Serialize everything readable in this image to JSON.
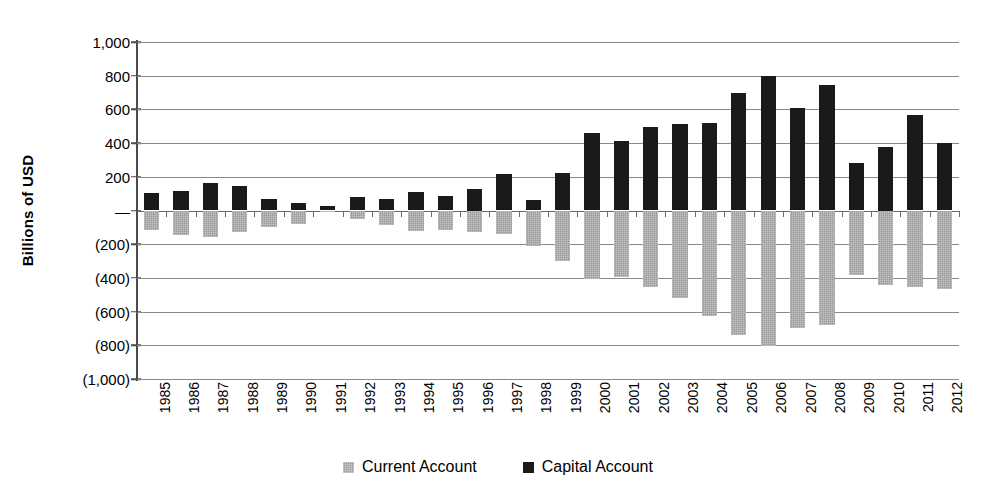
{
  "chart_data": {
    "type": "bar",
    "title": "",
    "subtitle": "",
    "xlabel": "",
    "ylabel": "Billions of USD",
    "ylim": [
      -1000,
      1000
    ],
    "ytick_values": [
      1000,
      800,
      600,
      400,
      200,
      0,
      -200,
      -400,
      -600,
      -800,
      -1000
    ],
    "ytick_labels": [
      "1,000",
      "800",
      "600",
      "400",
      "200",
      "—",
      "(200)",
      "(400)",
      "(600)",
      "(800)",
      "(1,000)"
    ],
    "grid": true,
    "legend_position": "bottom",
    "orientation": "vertical",
    "grouping": "grouped-overlay",
    "categories": [
      "1985",
      "1986",
      "1987",
      "1988",
      "1989",
      "1990",
      "1991",
      "1992",
      "1993",
      "1994",
      "1995",
      "1996",
      "1997",
      "1998",
      "1999",
      "2000",
      "2001",
      "2002",
      "2003",
      "2004",
      "2005",
      "2006",
      "2007",
      "2008",
      "2009",
      "2010",
      "2011",
      "2012"
    ],
    "series": [
      {
        "name": "Capital Account",
        "color": "#1a1a1a",
        "values": [
          105,
          115,
          165,
          145,
          70,
          45,
          25,
          80,
          70,
          110,
          85,
          125,
          215,
          65,
          220,
          460,
          410,
          495,
          515,
          520,
          695,
          800,
          610,
          745,
          280,
          375,
          565,
          400
        ]
      },
      {
        "name": "Current Account",
        "color": "#9a9a9a",
        "values": [
          -118,
          -145,
          -160,
          -125,
          -100,
          -80,
          -5,
          -50,
          -85,
          -120,
          -115,
          -125,
          -140,
          -210,
          -300,
          -405,
          -395,
          -455,
          -520,
          -625,
          -740,
          -805,
          -700,
          -680,
          -380,
          -440,
          -455,
          -465
        ]
      }
    ]
  },
  "legend": {
    "items": [
      {
        "label": "Current Account",
        "swatch": "current"
      },
      {
        "label": "Capital Account",
        "swatch": "capital"
      }
    ]
  }
}
